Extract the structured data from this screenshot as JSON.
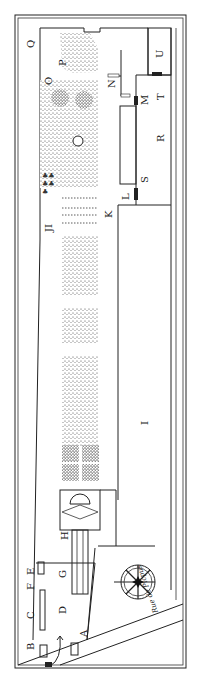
{
  "map": {
    "street_label": "Rue de Picpus",
    "compass_label": "compass-rose",
    "north_mark": "N",
    "labels": {
      "A": "A",
      "B": "B",
      "C": "C",
      "D": "D",
      "E": "E",
      "F": "F",
      "G": "G",
      "H": "H",
      "I": "I",
      "J": "J",
      "K": "K",
      "L": "L",
      "M": "M",
      "N": "N",
      "O": "O",
      "P": "P",
      "Q": "Q",
      "R": "R",
      "S": "S",
      "T": "T",
      "U": "U",
      "JI": "JI"
    },
    "colors": {
      "ink": "#1a1a1a",
      "paper": "#ffffff",
      "stipple": "#555555"
    }
  }
}
